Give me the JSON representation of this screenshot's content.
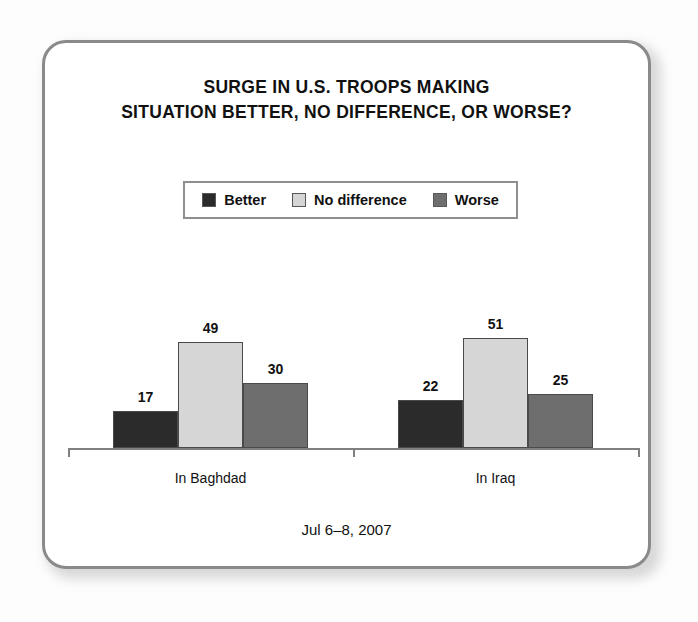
{
  "card": {
    "border_color": "#8a8a8a",
    "background": "#ffffff"
  },
  "title": {
    "line1": "SURGE IN U.S. TROOPS MAKING",
    "line2": "SITUATION BETTER, NO DIFFERENCE, OR WORSE?"
  },
  "legend": [
    {
      "label": "Better",
      "color": "#2b2b2b"
    },
    {
      "label": "No difference",
      "color": "#d6d6d6"
    },
    {
      "label": "Worse",
      "color": "#6e6e6e"
    }
  ],
  "footer": {
    "date": "Jul 6–8, 2007"
  },
  "chart_data": {
    "type": "bar",
    "title": "SURGE IN U.S. TROOPS MAKING SITUATION BETTER, NO DIFFERENCE, OR WORSE?",
    "subtitle": "",
    "xlabel": "",
    "ylabel": "",
    "categories": [
      "In Baghdad",
      "In Iraq"
    ],
    "series": [
      {
        "name": "Better",
        "color": "#2b2b2b",
        "values": [
          17,
          22
        ]
      },
      {
        "name": "No difference",
        "color": "#d6d6d6",
        "values": [
          49,
          51
        ]
      },
      {
        "name": "Worse",
        "color": "#6e6e6e",
        "values": [
          30,
          25
        ]
      }
    ],
    "ylim": [
      0,
      60
    ],
    "grid": false,
    "legend_position": "top-center",
    "value_labels": true,
    "annotation": "Jul 6–8, 2007"
  }
}
